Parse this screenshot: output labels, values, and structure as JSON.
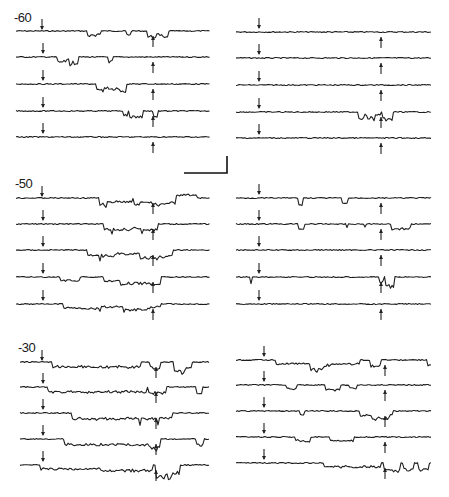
{
  "figure": {
    "type": "electrophysiology-traces",
    "panels": [
      {
        "label": "-60",
        "rows": [
          31,
          57,
          84,
          111,
          137
        ],
        "left_traces": [
          {
            "events": [
              [
                88,
                96,
                5
              ],
              [
                96,
                100,
                3
              ],
              [
                126,
                130,
                4
              ],
              [
                148,
                156,
                6
              ],
              [
                156,
                162,
                4
              ],
              [
                162,
                168,
                7
              ]
            ]
          },
          {
            "events": [
              [
                58,
                66,
                5
              ],
              [
                66,
                70,
                3
              ],
              [
                70,
                78,
                6
              ],
              [
                108,
                112,
                5
              ]
            ]
          },
          {
            "events": [
              [
                96,
                104,
                7
              ],
              [
                104,
                108,
                4
              ],
              [
                108,
                114,
                6
              ],
              [
                114,
                120,
                5
              ],
              [
                120,
                126,
                7
              ]
            ]
          },
          {
            "events": [
              [
                124,
                128,
                4
              ],
              [
                130,
                142,
                6
              ],
              [
                154,
                158,
                6
              ]
            ]
          },
          {
            "events": []
          }
        ],
        "right_traces": [
          {
            "events": []
          },
          {
            "events": []
          },
          {
            "events": []
          },
          {
            "events": [
              [
                358,
                364,
                6
              ],
              [
                364,
                368,
                3
              ],
              [
                368,
                374,
                6
              ],
              [
                374,
                380,
                3
              ],
              [
                382,
                392,
                8
              ]
            ]
          },
          {
            "events": []
          }
        ]
      },
      {
        "label": "-50",
        "rows": [
          198,
          224,
          250,
          277,
          304
        ],
        "left_traces": [
          {
            "events": [
              [
                100,
                106,
                7
              ],
              [
                106,
                132,
                4
              ],
              [
                134,
                140,
                6
              ],
              [
                140,
                152,
                4
              ],
              [
                152,
                162,
                7
              ],
              [
                162,
                176,
                5
              ],
              [
                176,
                196,
                -3
              ]
            ]
          },
          {
            "events": [
              [
                104,
                112,
                5
              ],
              [
                112,
                132,
                6
              ],
              [
                132,
                142,
                4
              ],
              [
                142,
                158,
                6
              ]
            ]
          },
          {
            "events": [
              [
                88,
                100,
                5
              ],
              [
                100,
                116,
                6
              ],
              [
                116,
                140,
                4
              ],
              [
                140,
                158,
                8
              ],
              [
                158,
                172,
                7
              ]
            ]
          },
          {
            "events": [
              [
                60,
                80,
                4
              ],
              [
                104,
                120,
                4
              ],
              [
                120,
                150,
                7
              ],
              [
                150,
                160,
                8
              ]
            ]
          },
          {
            "events": [
              [
                64,
                80,
                4
              ],
              [
                80,
                100,
                5
              ],
              [
                100,
                124,
                3
              ],
              [
                124,
                150,
                6
              ],
              [
                150,
                160,
                3
              ]
            ]
          }
        ],
        "right_traces": [
          {
            "events": [
              [
                298,
                302,
                7
              ],
              [
                342,
                348,
                6
              ]
            ]
          },
          {
            "events": [
              [
                298,
                304,
                5
              ],
              [
                346,
                348,
                4
              ],
              [
                364,
                366,
                3
              ],
              [
                392,
                410,
                5
              ]
            ]
          },
          {
            "events": []
          },
          {
            "events": [
              [
                250,
                252,
                6
              ],
              [
                380,
                384,
                5
              ],
              [
                386,
                390,
                9
              ],
              [
                390,
                394,
                10
              ]
            ]
          },
          {
            "events": []
          }
        ]
      },
      {
        "label": "-30",
        "rows": [
          362,
          387,
          413,
          439,
          465
        ],
        "left_traces": [
          {
            "events": [
              [
                52,
                140,
                5
              ],
              [
                150,
                160,
                6
              ],
              [
                174,
                186,
                10
              ],
              [
                186,
                192,
                6
              ]
            ]
          },
          {
            "events": [
              [
                48,
                146,
                5
              ],
              [
                148,
                166,
                6
              ],
              [
                196,
                202,
                6
              ]
            ]
          },
          {
            "events": [
              [
                72,
                140,
                6
              ],
              [
                140,
                158,
                6
              ],
              [
                158,
                172,
                5
              ]
            ]
          },
          {
            "events": [
              [
                64,
                150,
                6
              ],
              [
                150,
                160,
                10
              ],
              [
                196,
                204,
                6
              ]
            ]
          },
          {
            "events": [
              [
                40,
                100,
                4
              ],
              [
                100,
                152,
                6
              ],
              [
                156,
                172,
                12
              ],
              [
                172,
                180,
                8
              ]
            ]
          }
        ],
        "right_traces": [
          {
            "events": [
              [
                276,
                324,
                4
              ],
              [
                310,
                330,
                6
              ],
              [
                330,
                360,
                4
              ],
              [
                370,
                380,
                6
              ],
              [
                428,
                434,
                5
              ]
            ]
          },
          {
            "events": [
              [
                286,
                296,
                4
              ],
              [
                326,
                340,
                5
              ],
              [
                350,
                356,
                3
              ]
            ]
          },
          {
            "events": [
              [
                300,
                304,
                4
              ],
              [
                360,
                372,
                5
              ],
              [
                372,
                390,
                8
              ],
              [
                390,
                392,
                4
              ]
            ]
          },
          {
            "events": [
              [
                296,
                310,
                4
              ],
              [
                330,
                354,
                4
              ]
            ]
          },
          {
            "events": [
              [
                324,
                380,
                4
              ],
              [
                384,
                400,
                8
              ],
              [
                404,
                414,
                7
              ],
              [
                418,
                428,
                7
              ]
            ]
          }
        ]
      }
    ],
    "left_x": [
      16,
      210
    ],
    "right_x": [
      236,
      431
    ],
    "down_arrow_x": {
      "left": 43,
      "right": 259
    },
    "up_arrow_x": {
      "left": 153,
      "right": 381
    },
    "scale_bar": {
      "x1": 184,
      "x2": 227,
      "y_bottom": 173,
      "y_top": 156
    }
  }
}
